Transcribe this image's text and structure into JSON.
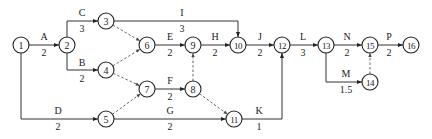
{
  "diagram": {
    "type": "activity-on-arrow network",
    "nodes": [
      {
        "id": "1",
        "x": 21,
        "y": 45
      },
      {
        "id": "2",
        "x": 67,
        "y": 45
      },
      {
        "id": "3",
        "x": 106,
        "y": 21
      },
      {
        "id": "4",
        "x": 106,
        "y": 70
      },
      {
        "id": "5",
        "x": 106,
        "y": 119
      },
      {
        "id": "6",
        "x": 147,
        "y": 45
      },
      {
        "id": "7",
        "x": 147,
        "y": 89
      },
      {
        "id": "8",
        "x": 193,
        "y": 89
      },
      {
        "id": "9",
        "x": 193,
        "y": 45
      },
      {
        "id": "10",
        "x": 238,
        "y": 45
      },
      {
        "id": "11",
        "x": 234,
        "y": 119
      },
      {
        "id": "12",
        "x": 282,
        "y": 45
      },
      {
        "id": "13",
        "x": 326,
        "y": 45
      },
      {
        "id": "14",
        "x": 370,
        "y": 82
      },
      {
        "id": "15",
        "x": 370,
        "y": 45
      },
      {
        "id": "16",
        "x": 411,
        "y": 45
      }
    ],
    "activities": [
      {
        "name": "A",
        "duration": "2",
        "from": "1",
        "to": "2",
        "path": [
          [
            21,
            45
          ],
          [
            67,
            45
          ]
        ],
        "label_x": 44,
        "top_y": 40,
        "bot_y": 56
      },
      {
        "name": "C",
        "duration": "3",
        "from": "2",
        "to": "3",
        "path": [
          [
            67,
            45
          ],
          [
            67,
            21
          ],
          [
            106,
            21
          ]
        ],
        "label_x": 82,
        "top_y": 16,
        "bot_y": 32
      },
      {
        "name": "B",
        "duration": "2",
        "from": "2",
        "to": "4",
        "path": [
          [
            67,
            45
          ],
          [
            67,
            70
          ],
          [
            106,
            70
          ]
        ],
        "label_x": 82,
        "top_y": 66,
        "bot_y": 82
      },
      {
        "name": "D",
        "duration": "2",
        "from": "1",
        "to": "5",
        "path": [
          [
            21,
            45
          ],
          [
            21,
            119
          ],
          [
            106,
            119
          ]
        ],
        "label_x": 58,
        "top_y": 114,
        "bot_y": 130
      },
      {
        "name": "I",
        "duration": "3",
        "from": "3",
        "to": "10",
        "path": [
          [
            106,
            21
          ],
          [
            238,
            21
          ],
          [
            238,
            45
          ]
        ],
        "label_x": 182,
        "top_y": 16,
        "bot_y": 32
      },
      {
        "name": "E",
        "duration": "2",
        "from": "6",
        "to": "9",
        "path": [
          [
            147,
            45
          ],
          [
            193,
            45
          ]
        ],
        "label_x": 170,
        "top_y": 40,
        "bot_y": 56
      },
      {
        "name": "H",
        "duration": "2",
        "from": "9",
        "to": "10",
        "path": [
          [
            193,
            45
          ],
          [
            238,
            45
          ]
        ],
        "label_x": 215,
        "top_y": 40,
        "bot_y": 56
      },
      {
        "name": "J",
        "duration": "2",
        "from": "10",
        "to": "12",
        "path": [
          [
            238,
            45
          ],
          [
            282,
            45
          ]
        ],
        "label_x": 260,
        "top_y": 40,
        "bot_y": 56
      },
      {
        "name": "F",
        "duration": "2",
        "from": "7",
        "to": "8",
        "path": [
          [
            147,
            89
          ],
          [
            193,
            89
          ]
        ],
        "label_x": 170,
        "top_y": 84,
        "bot_y": 100
      },
      {
        "name": "G",
        "duration": "2",
        "from": "5",
        "to": "11",
        "path": [
          [
            106,
            119
          ],
          [
            234,
            119
          ]
        ],
        "label_x": 170,
        "top_y": 114,
        "bot_y": 130
      },
      {
        "name": "K",
        "duration": "1",
        "from": "11",
        "to": "12",
        "path": [
          [
            234,
            119
          ],
          [
            282,
            119
          ],
          [
            282,
            45
          ]
        ],
        "label_x": 259,
        "top_y": 114,
        "bot_y": 130
      },
      {
        "name": "L",
        "duration": "3",
        "from": "12",
        "to": "13",
        "path": [
          [
            282,
            45
          ],
          [
            326,
            45
          ]
        ],
        "label_x": 303,
        "top_y": 40,
        "bot_y": 56
      },
      {
        "name": "N",
        "duration": "2",
        "from": "13",
        "to": "15",
        "path": [
          [
            326,
            45
          ],
          [
            370,
            45
          ]
        ],
        "label_x": 347,
        "top_y": 40,
        "bot_y": 56
      },
      {
        "name": "M",
        "duration": "1.5",
        "from": "13",
        "to": "14",
        "path": [
          [
            326,
            45
          ],
          [
            326,
            82
          ],
          [
            370,
            82
          ]
        ],
        "label_x": 346,
        "top_y": 77,
        "bot_y": 93
      },
      {
        "name": "P",
        "duration": "2",
        "from": "15",
        "to": "16",
        "path": [
          [
            370,
            45
          ],
          [
            411,
            45
          ]
        ],
        "label_x": 389,
        "top_y": 40,
        "bot_y": 56
      }
    ],
    "dummies": [
      {
        "from": "3",
        "to": "6"
      },
      {
        "from": "4",
        "to": "6"
      },
      {
        "from": "4",
        "to": "7"
      },
      {
        "from": "5",
        "to": "7"
      },
      {
        "from": "8",
        "to": "9"
      },
      {
        "from": "8",
        "to": "11"
      },
      {
        "from": "14",
        "to": "15"
      }
    ],
    "colors": {
      "line": "#333333",
      "dashed": "#555555",
      "text": "#222222"
    }
  }
}
